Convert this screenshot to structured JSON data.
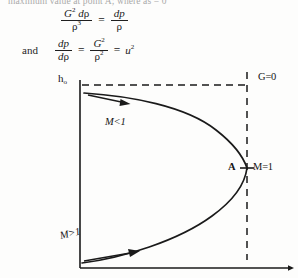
{
  "page": {
    "cropped_header_text": "maximum value at point A; where as    = 0"
  },
  "equations": {
    "eq1": {
      "lhs_numerator": "G² dρ",
      "lhs_denominator": "ρ³",
      "equals": "=",
      "rhs_numerator": "dp",
      "rhs_denominator": "ρ"
    },
    "eq2": {
      "lead_word": "and",
      "lhs_numerator": "dp",
      "lhs_denominator": "dρ",
      "equals_1": "=",
      "mid_numerator": "G²",
      "mid_denominator": "ρ²",
      "equals_2": "=",
      "rhs": "u²"
    }
  },
  "diagram": {
    "type": "fanno-line-h-s-diagram",
    "y_axis_label": "h",
    "y_axis_subscript": "o",
    "constant_line_label": "G=0",
    "point_label": "A",
    "point_condition_label": "M=1",
    "upper_branch_label": "M<1",
    "lower_branch_label": "M>1",
    "colors": {
      "ink": "#141414",
      "paper": "#fdfdfc"
    },
    "geometry": {
      "y_axis_x": 80,
      "y_axis_top": 20,
      "y_axis_bottom": 208,
      "x_axis_y": 208,
      "x_axis_right": 292,
      "horizontal_dashed_y": 25,
      "vertical_dashed_x": 247,
      "vertical_dashed_top": 12,
      "nose_point": [
        247,
        108
      ]
    }
  }
}
